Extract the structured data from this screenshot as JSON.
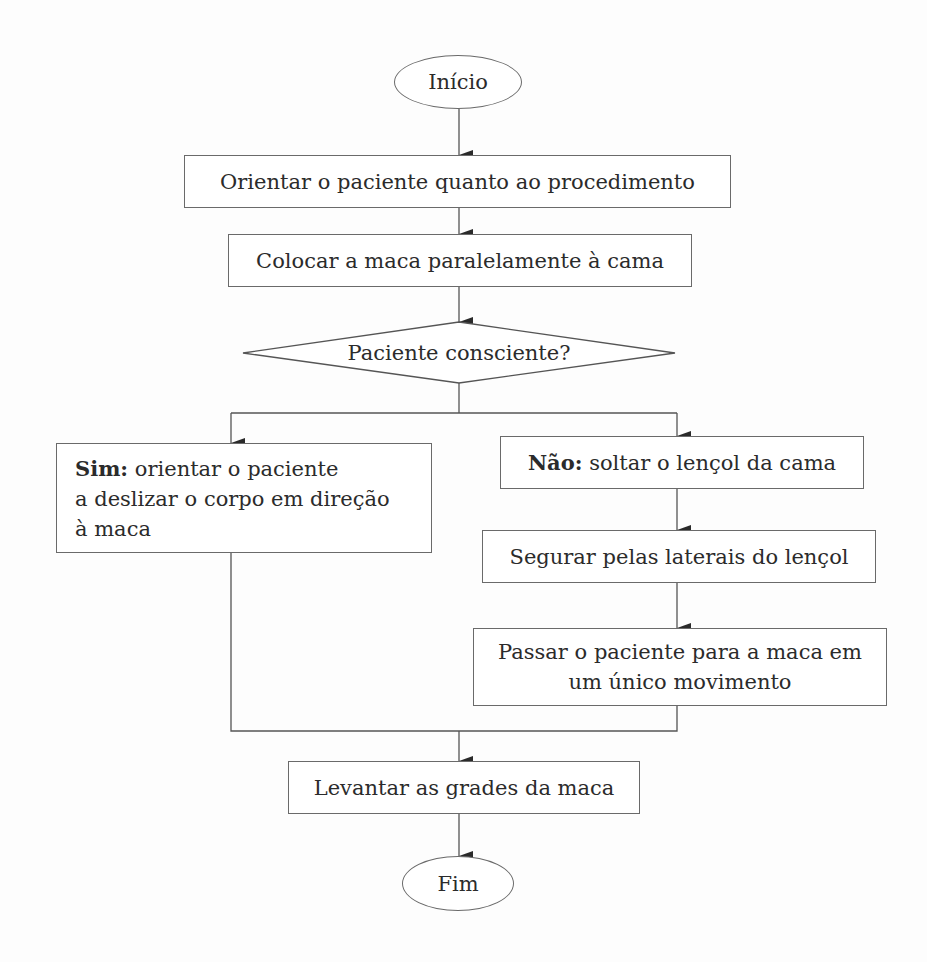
{
  "flowchart": {
    "start": {
      "label": "Início"
    },
    "steps": [
      {
        "id": "orientar",
        "label": "Orientar o paciente quanto ao procedimento"
      },
      {
        "id": "colocar",
        "label": "Colocar a maca paralelamente à cama"
      }
    ],
    "decision": {
      "label": "Paciente consciente?"
    },
    "branch_yes": {
      "prefix": "Sim:",
      "line1": " orientar o paciente",
      "line2": "a deslizar o corpo em direção",
      "line3": "à maca"
    },
    "branch_no": {
      "prefix": "Não:",
      "text": " soltar o lençol da cama",
      "steps": [
        {
          "id": "segurar",
          "label": "Segurar pelas laterais do lençol"
        },
        {
          "id": "passar",
          "line1": "Passar o paciente para a maca em",
          "line2": "um único movimento"
        }
      ]
    },
    "final_step": {
      "label": "Levantar as grades da maca"
    },
    "end": {
      "label": "Fim"
    },
    "colors": {
      "line": "#555555",
      "text": "#2b2b2b",
      "background": "#fdfdfd"
    }
  }
}
